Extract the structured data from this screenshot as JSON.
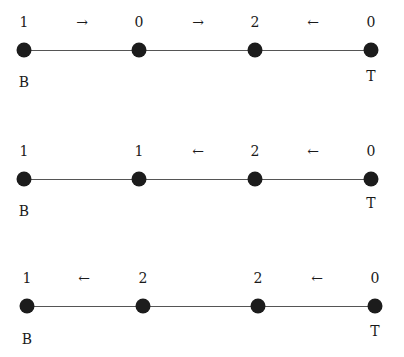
{
  "diagrams": [
    {
      "values": [
        "1",
        "0",
        "2",
        "0"
      ],
      "arrows": [
        "→",
        "→",
        "←"
      ],
      "bottom_label": "B",
      "top_label": "T"
    },
    {
      "values": [
        "1",
        "1",
        "2",
        "0"
      ],
      "arrows": [
        "",
        "←",
        "←"
      ],
      "bottom_label": "B",
      "top_label": "T"
    },
    {
      "values": [
        "1",
        "2",
        "2",
        "0"
      ],
      "arrows": [
        "←",
        "",
        "←"
      ],
      "bottom_label": "B",
      "top_label": "T"
    }
  ]
}
